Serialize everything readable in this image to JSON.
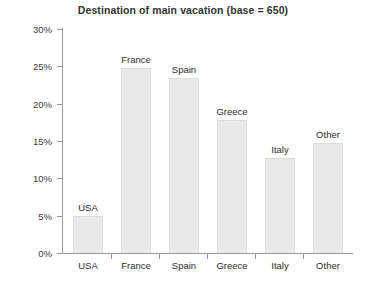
{
  "chart_data": {
    "type": "bar",
    "title": "Destination of main vacation (base = 650)",
    "xlabel": "",
    "ylabel": "",
    "categories": [
      "USA",
      "France",
      "Spain",
      "Greece",
      "Italy",
      "Other"
    ],
    "values": [
      5.0,
      24.8,
      23.5,
      17.8,
      12.7,
      14.7
    ],
    "bar_labels": [
      "USA",
      "France",
      "Spain",
      "Greece",
      "Italy",
      "Other"
    ],
    "ylim": [
      0,
      30
    ],
    "yticks": [
      0,
      5,
      10,
      15,
      20,
      25,
      30
    ],
    "ytick_labels": [
      "0%",
      "5%",
      "10%",
      "15%",
      "20%",
      "25%",
      "30%"
    ],
    "grid": false,
    "legend": "none",
    "bar_color": "#e9e9e9",
    "axis_color": "#9a9a9a",
    "text_color": "#2e2e2e",
    "title_color": "#333333",
    "background": "#ffffff"
  }
}
